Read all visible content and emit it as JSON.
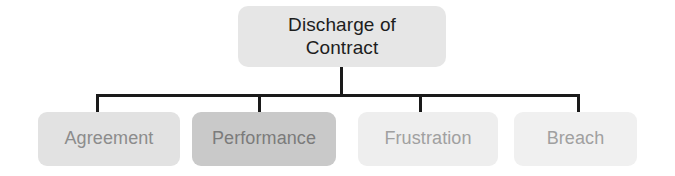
{
  "diagram": {
    "title": "Discharge of Contract",
    "type": "hierarchy-tree",
    "orientation": "top-down",
    "colors": {
      "background": "#ffffff",
      "connector": "#1a1a1a",
      "root_fill": "#e6e6e6",
      "root_text": "#1d1d1d"
    },
    "root": {
      "label": "Discharge of\nContract",
      "line1": "Discharge of",
      "line2": "Contract",
      "fill": "#e6e6e6",
      "text_color": "#1d1d1d"
    },
    "children": [
      {
        "label": "Agreement",
        "fill": "#e2e2e2",
        "text_color": "#8c8c8c"
      },
      {
        "label": "Performance",
        "fill": "#c9c9c9",
        "text_color": "#7b7b7b"
      },
      {
        "label": "Frustration",
        "fill": "#eeeeee",
        "text_color": "#a0a0a0"
      },
      {
        "label": "Breach",
        "fill": "#f0f0f0",
        "text_color": "#a0a0a0"
      }
    ]
  }
}
